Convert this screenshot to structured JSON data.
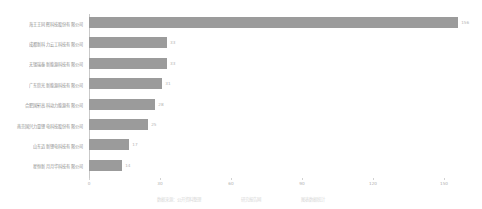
{
  "chart_data": {
    "type": "bar",
    "orientation": "horizontal",
    "title": "",
    "xlabel": "",
    "ylabel": "",
    "xlim": [
      0,
      150
    ],
    "xticks": [
      0,
      30,
      60,
      90,
      120,
      150
    ],
    "xtick_labels": [
      "0",
      "30",
      "60",
      "90",
      "120",
      "150"
    ],
    "grid": false,
    "legend": null,
    "bar_color": "#9b9b9b",
    "axis_color": "#c9c9c9",
    "label_color": "#8d8d8d",
    "value_label_color": "#b4b4b4",
    "categories": [
      "海王王同辉科技股份有限公司",
      "成都新科力云工科技有限公司",
      "无锡瑞泰新能源科技有限公司",
      "广东欣光新能源科技有限公司",
      "合肥国轩高科动力能源有限公司",
      "南京国兴力量锂电科技股份有限公司",
      "山东迈新锂电科技有限公司",
      "星恒新月月华科技有限公司"
    ],
    "values": [
      156,
      33,
      33,
      31,
      28,
      25,
      17,
      14
    ],
    "value_labels": [
      "156",
      "33",
      "33",
      "31",
      "28",
      "25",
      "17",
      "14"
    ]
  },
  "caption": {
    "text": "数据来源：公开资料整理　　　　　　　　　　研究报告网　　　　　　　　　　图表数据统计"
  }
}
